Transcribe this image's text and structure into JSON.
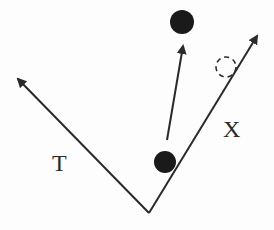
{
  "diagram": {
    "axes": [
      {
        "name": "T",
        "label": "T",
        "from": [
          149,
          213
        ],
        "to": [
          16,
          77
        ]
      },
      {
        "name": "X",
        "label": "X",
        "from": [
          149,
          213
        ],
        "to": [
          259,
          33
        ]
      }
    ],
    "points": [
      {
        "name": "origin-particle",
        "type": "filled",
        "cx": 165,
        "cy": 162,
        "r": 11
      },
      {
        "name": "moved-particle",
        "type": "filled",
        "cx": 182,
        "cy": 22,
        "r": 12
      },
      {
        "name": "projected-position",
        "type": "dashed",
        "cx": 226,
        "cy": 67,
        "r": 11
      }
    ],
    "vectors": [
      {
        "name": "displacement-arrow",
        "from": [
          167,
          140
        ],
        "to": [
          184,
          43
        ]
      }
    ],
    "colors": {
      "stroke": "#2a2a2a",
      "fill": "#1a1a1a",
      "background": "#fdfdfd"
    }
  }
}
